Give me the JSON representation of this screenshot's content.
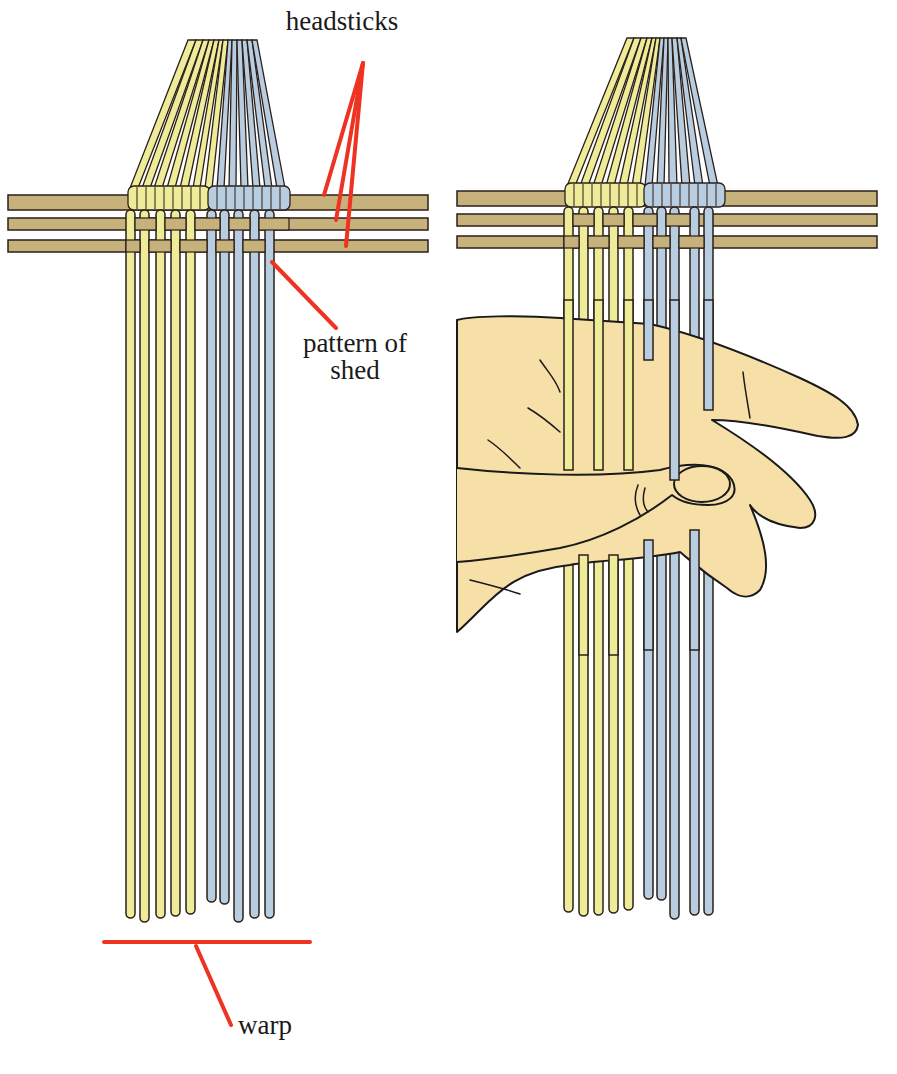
{
  "diagram": {
    "panels": [
      {
        "id": "left",
        "description": "warp threads bundled through headsticks with pattern of shed"
      },
      {
        "id": "right",
        "description": "hand picking up the shed from the warp"
      }
    ],
    "labels": {
      "headsticks": "headsticks",
      "pattern_of_shed_line1": "pattern of",
      "pattern_of_shed_line2": "shed",
      "warp": "warp"
    },
    "colors": {
      "headstick": "#c8b27c",
      "warp_yellow": "#eeec98",
      "warp_blue": "#b9cde0",
      "outline": "#2a1f1a",
      "leader_line": "#ee3322",
      "skin": "#f7dfa8"
    }
  }
}
